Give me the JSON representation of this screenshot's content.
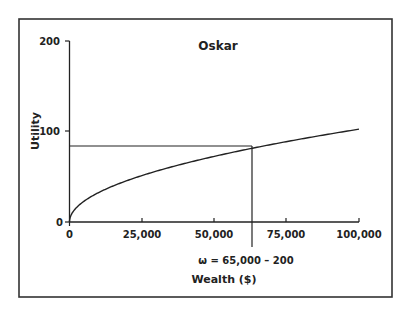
{
  "chart_data": {
    "type": "line",
    "title": "Oskar",
    "xlabel": "Wealth ($)",
    "ylabel": "Utility",
    "xlim": [
      0,
      100000
    ],
    "ylim": [
      0,
      200
    ],
    "x_ticks": [
      0,
      25000,
      50000,
      75000,
      100000
    ],
    "x_tick_labels": [
      "0",
      "25,000",
      "50,000",
      "75,000",
      "100,000"
    ],
    "y_ticks": [
      0,
      100,
      200
    ],
    "y_tick_labels": [
      "0",
      "100",
      "200"
    ],
    "grid": false,
    "legend": null,
    "series": [
      {
        "name": "Utility of wealth",
        "x": [
          0,
          1000,
          5000,
          10000,
          25000,
          50000,
          65000,
          75000,
          100000
        ],
        "y": [
          0,
          10,
          23,
          32,
          51,
          72,
          83,
          88,
          102
        ]
      }
    ],
    "reference_lines": {
      "horizontal": {
        "y": 83,
        "x_from": 0,
        "x_to": 65000
      },
      "vertical": {
        "x": 65000,
        "y_from": 83,
        "extends_below_axis": true
      }
    },
    "annotations": [
      {
        "text": "ω = 65,000 – 200",
        "x": 65000,
        "position": "below x-axis"
      }
    ]
  },
  "colors": {
    "line": "#222222",
    "frame": "#333333",
    "background": "#ffffff"
  }
}
